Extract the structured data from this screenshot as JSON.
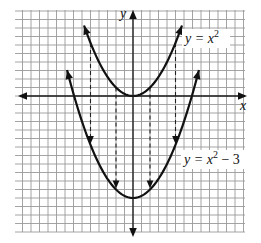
{
  "figure": {
    "axes": {
      "x_label": "x",
      "y_label": "y"
    },
    "grid": true
  },
  "chart_data": {
    "type": "line",
    "title": "",
    "xlabel": "x",
    "ylabel": "y",
    "grid": true,
    "xlim": [
      -3.4,
      3.4
    ],
    "ylim": [
      -4.0,
      2.6
    ],
    "series": [
      {
        "name": "y = x^2",
        "label": "y = x",
        "label_sup": "2",
        "label_tail": "",
        "expression": "x^2",
        "shift": 0,
        "x_range": [
          -1.44,
          1.44
        ],
        "style": "solid"
      },
      {
        "name": "y = x^2 - 3",
        "label": "y = x",
        "label_sup": "2",
        "label_tail": " − 3",
        "expression": "x^2 - 3",
        "shift": -3,
        "x_range": [
          -1.94,
          1.94
        ],
        "style": "solid"
      }
    ],
    "shift_arrows": {
      "x": [
        -1.25,
        -0.5,
        0.5,
        1.25
      ],
      "from": "y = x^2",
      "to": "y = x^2 - 3",
      "style": "dashed",
      "direction": "down"
    },
    "grid_cells_per_unit": 4
  }
}
